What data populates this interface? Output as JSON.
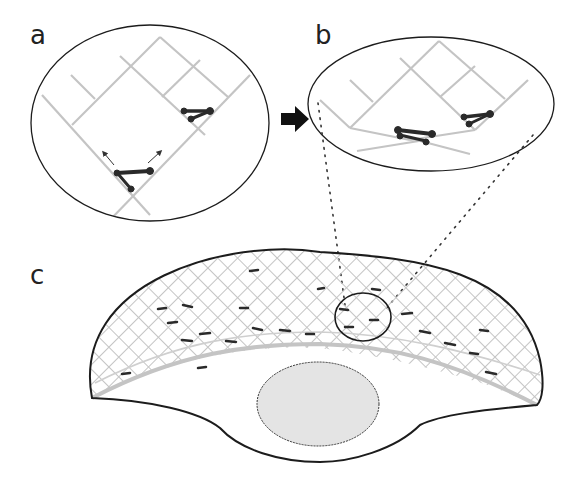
{
  "figure": {
    "panels": [
      {
        "id": "a",
        "label": "a",
        "description": "Magnified view of filament network with two motor complexes; arrows indicate motion directions"
      },
      {
        "id": "b",
        "label": "b",
        "description": "Magnified view after contraction: filaments bent and pulled together by motors"
      },
      {
        "id": "c",
        "label": "c",
        "description": "Whole cell with crescent-shaped lamellipodium containing a diagonal filament mesh and motor complexes; circled region corresponds to panel b"
      }
    ],
    "arrow": {
      "direction": "right",
      "meaning": "transition from a to b"
    },
    "colors": {
      "filament": "#c4c4c4",
      "motor": "#2a2a2a",
      "outline": "#1c1c1c",
      "nucleus_fill": "#e4e4e4",
      "dotted_guides": "#333333"
    }
  }
}
